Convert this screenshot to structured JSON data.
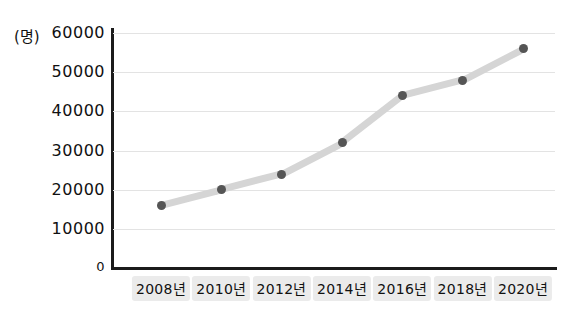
{
  "chart_data": {
    "type": "line",
    "title": "",
    "xlabel": "",
    "ylabel": "(명)",
    "unit_label": "(명)",
    "categories": [
      "2008년",
      "2010년",
      "2012년",
      "2014년",
      "2016년",
      "2018년",
      "2020년"
    ],
    "values": [
      16000,
      20000,
      24000,
      32000,
      44000,
      48000,
      56000
    ],
    "series": [
      {
        "name": "",
        "values": [
          16000,
          20000,
          24000,
          32000,
          44000,
          48000,
          56000
        ]
      }
    ],
    "ylim": [
      0,
      60000
    ],
    "yticks": [
      0,
      10000,
      20000,
      30000,
      40000,
      50000,
      60000
    ],
    "ytick_labels": [
      "0",
      "10000",
      "20000",
      "30000",
      "40000",
      "50000",
      "60000"
    ],
    "grid": true,
    "legend": "none",
    "colors": {
      "line": "#d5d5d5",
      "marker": "#555555",
      "axis": "#1b1b1b",
      "grid": "#e3e3e3",
      "label_background": "#ebebeb",
      "text": "#111111"
    }
  }
}
